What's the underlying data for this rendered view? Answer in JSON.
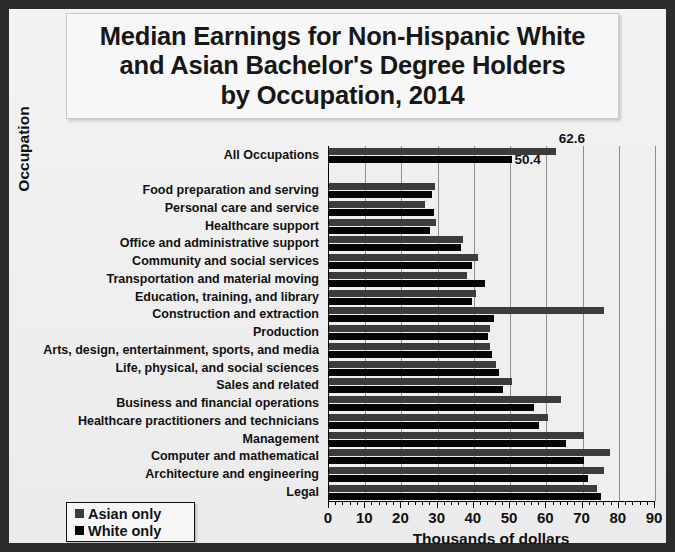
{
  "chart_data": {
    "type": "bar",
    "orientation": "horizontal",
    "title": "Median Earnings for Non-Hispanic White\nand Asian Bachelor's Degree Holders\nby Occupation, 2014",
    "xlabel": "Thousands of dollars",
    "ylabel": "Occupation",
    "xlim": [
      0,
      90
    ],
    "xticks": [
      0,
      10,
      20,
      30,
      40,
      50,
      60,
      70,
      80,
      90
    ],
    "xticklabels": [
      "0",
      "10",
      "20",
      "30",
      "40",
      "50",
      "60",
      "70",
      "80",
      "90"
    ],
    "minor_tick_step": 2,
    "grid": true,
    "legend_position": "bottom-left",
    "categories": [
      "All Occupations",
      "",
      "Food preparation and serving",
      "Personal care and service",
      "Healthcare support",
      "Office and administrative support",
      "Community and social services",
      "Transportation and material moving",
      "Education, training, and library",
      "Construction and extraction",
      "Production",
      "Arts, design, entertainment, sports, and media",
      "Life, physical, and social sciences",
      "Sales and related",
      "Business and financial operations",
      "Healthcare practitioners and technicians",
      "Management",
      "Computer and mathematical",
      "Architecture and engineering",
      "Legal"
    ],
    "series": [
      {
        "name": "Asian only",
        "color": "#3c3c3c",
        "values": [
          62.6,
          null,
          29.3,
          26.5,
          29.5,
          37.0,
          41.0,
          38.0,
          40.5,
          76.0,
          44.5,
          44.5,
          46.0,
          50.5,
          64.0,
          60.5,
          70.5,
          77.5,
          76.0,
          74.0
        ]
      },
      {
        "name": "White only",
        "color": "#050505",
        "values": [
          50.4,
          null,
          28.5,
          29.0,
          28.0,
          36.5,
          39.5,
          43.0,
          39.5,
          45.5,
          44.0,
          45.0,
          47.0,
          48.0,
          56.5,
          58.0,
          65.5,
          70.5,
          71.5,
          75.0
        ]
      }
    ],
    "data_labels": [
      {
        "text": "62.6",
        "series": "Asian only",
        "category": "All Occupations"
      },
      {
        "text": "50.4",
        "series": "White only",
        "category": "All Occupations"
      }
    ]
  },
  "legend": {
    "items": [
      {
        "label": "Asian only",
        "color": "#3c3c3c"
      },
      {
        "label": "White only",
        "color": "#050505"
      }
    ]
  }
}
